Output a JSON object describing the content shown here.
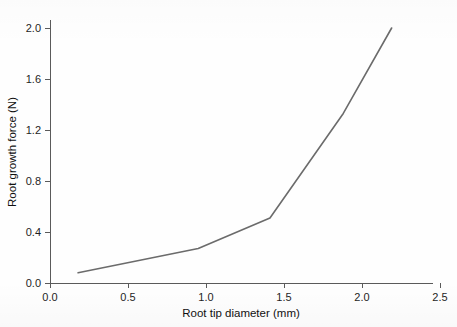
{
  "chart_data": {
    "type": "line",
    "title": "",
    "xlabel": "Root tip diameter (mm)",
    "ylabel": "Root growth force (N)",
    "xlim": [
      0.0,
      2.5
    ],
    "ylim": [
      0.0,
      2.5
    ],
    "grid": false,
    "legend": "none",
    "line_color": "#6b6b6b",
    "xticks": [
      "0.0",
      "0.5",
      "1.0",
      "1.5",
      "2.0",
      "2.5"
    ],
    "xtick_values": [
      0.0,
      0.5,
      1.0,
      1.5,
      2.0,
      2.5
    ],
    "yticks": [
      "0.0",
      "0.4",
      "0.8",
      "1.2",
      "1.6",
      "2.0",
      "2.4"
    ],
    "ytick_values": [
      0.0,
      0.4,
      0.8,
      1.2,
      1.6,
      2.0,
      2.4
    ],
    "series": [
      {
        "name": "Root growth force",
        "x": [
          0.18,
          0.95,
          1.41,
          1.88,
          2.19
        ],
        "y": [
          0.08,
          0.27,
          0.51,
          1.33,
          2.0
        ]
      }
    ]
  }
}
